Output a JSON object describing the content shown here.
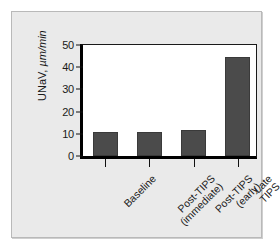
{
  "chart_data": {
    "type": "bar",
    "title": "",
    "subtitle": "",
    "xlabel": "",
    "ylabel": "UNaV, µm/min",
    "ylabel_name": "UNaV,",
    "ylabel_units": " µm/min",
    "categories": [
      "Baseline",
      "Post-TIPS\n(immediate)",
      "Post-TIPS\n(early)",
      "Late TIPS"
    ],
    "values": [
      10.4,
      10.6,
      11.3,
      43.0
    ],
    "ylim": [
      0,
      50
    ],
    "yticks": [
      0,
      10,
      20,
      30,
      40,
      50
    ],
    "ytick_labels": [
      "0",
      "10",
      "20",
      "30",
      "40",
      "50"
    ],
    "grid": false,
    "legend": "none",
    "bar_color": "#4b4b4b",
    "plot_background": "#ffffff",
    "panel_background": "#eaeaea",
    "axis_color": "#000000"
  }
}
